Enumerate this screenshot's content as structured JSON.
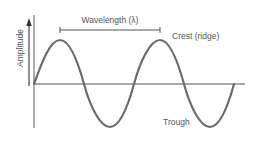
{
  "diagram": {
    "labels": {
      "y_axis": "Amplitude",
      "wavelength": "Wavelength (λ)",
      "crest": "Crest (ridge)",
      "trough": "Trough"
    },
    "colors": {
      "wave": "#6b6b6b",
      "axis": "#555555",
      "text": "#555555",
      "background": "#ffffff"
    },
    "wave": {
      "type": "sine",
      "cycles": 2,
      "axis_y": 84,
      "start_x": 34,
      "period_px": 100,
      "amplitude_px": 44
    }
  }
}
